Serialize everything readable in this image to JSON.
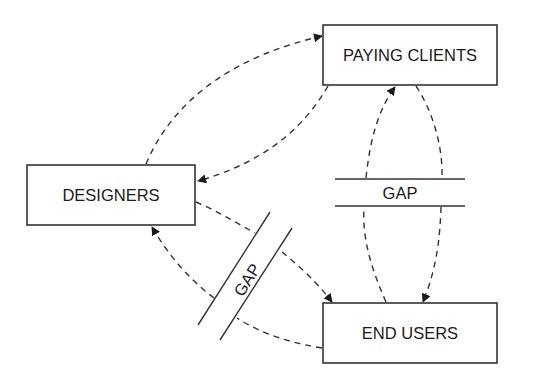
{
  "diagram": {
    "nodes": [
      {
        "id": "paying_clients",
        "label": "PAYING CLIENTS"
      },
      {
        "id": "designers",
        "label": "DESIGNERS"
      },
      {
        "id": "end_users",
        "label": "END USERS"
      }
    ],
    "gaps": [
      {
        "id": "gap_clients_users",
        "label": "GAP",
        "orientation": "horizontal",
        "between": [
          "paying_clients",
          "end_users"
        ]
      },
      {
        "id": "gap_designers_users",
        "label": "GAP",
        "orientation": "diagonal",
        "between": [
          "designers",
          "end_users"
        ]
      }
    ],
    "edges": [
      {
        "from": "designers",
        "to": "paying_clients",
        "style": "dashed",
        "arrow": "end"
      },
      {
        "from": "paying_clients",
        "to": "designers",
        "style": "dashed",
        "arrow": "end"
      },
      {
        "from": "end_users",
        "to": "paying_clients",
        "style": "dashed",
        "arrow": "end",
        "crosses_gap": "gap_clients_users"
      },
      {
        "from": "paying_clients",
        "to": "end_users",
        "style": "dashed",
        "arrow": "end",
        "crosses_gap": "gap_clients_users"
      },
      {
        "from": "designers",
        "to": "end_users",
        "style": "dashed",
        "arrow": "end",
        "crosses_gap": "gap_designers_users"
      },
      {
        "from": "end_users",
        "to": "designers",
        "style": "dashed",
        "arrow": "end",
        "crosses_gap": "gap_designers_users"
      }
    ],
    "colors": {
      "stroke": "#333333",
      "text": "#1a1a1a",
      "background": "#ffffff"
    }
  }
}
